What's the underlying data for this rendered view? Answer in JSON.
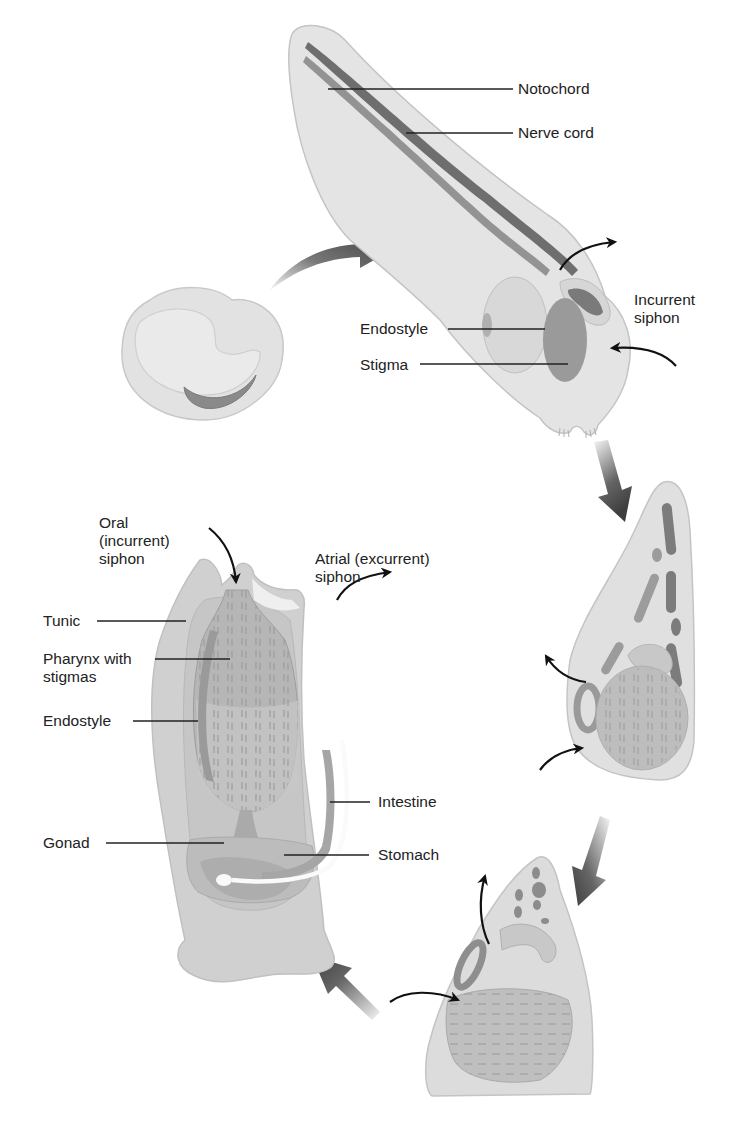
{
  "colors": {
    "background": "#ffffff",
    "body_light": "#e2e2e2",
    "body_mid": "#cfcfcf",
    "organ": "#b3b3b3",
    "organ_dark": "#8a8a8a",
    "notochord": "#6e6e6e",
    "nerve_cord": "#8c8c8c",
    "stage_arrow": "#4a4a4a",
    "flow_arrow": "#111111",
    "label_text": "#222222",
    "leader_line": "#222222"
  },
  "stages": [
    {
      "id": "egg",
      "name": "Embryo"
    },
    {
      "id": "larva",
      "name": "Tadpole larva"
    },
    {
      "id": "settling",
      "name": "Settled larva (early metamorphosis)"
    },
    {
      "id": "juvenile",
      "name": "Juvenile"
    },
    {
      "id": "adult",
      "name": "Adult"
    }
  ],
  "larva_labels": {
    "notochord": "Notochord",
    "nerve_cord": "Nerve cord",
    "endostyle": "Endostyle",
    "stigma": "Stigma",
    "incurrent_siphon": "Incurrent\nsiphon"
  },
  "adult_labels": {
    "oral_siphon": "Oral\n(incurrent)\nsiphon",
    "atrial_siphon": "Atrial (excurrent)\nsiphon",
    "tunic": "Tunic",
    "pharynx": "Pharynx with\nstigmas",
    "endostyle": "Endostyle",
    "intestine": "Intestine",
    "gonad": "Gonad",
    "stomach": "Stomach"
  }
}
